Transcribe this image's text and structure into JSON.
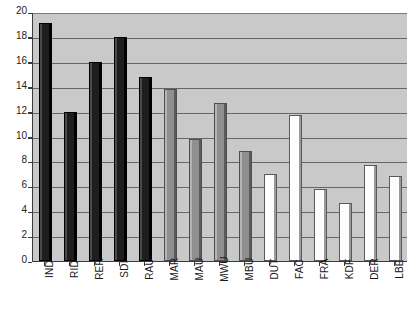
{
  "chart_data": {
    "type": "bar",
    "title": "",
    "subtitle": "",
    "xlabel": "",
    "ylabel": "",
    "ylim": [
      0,
      20
    ],
    "ytick_step": 2,
    "yticks": [
      "0",
      "2",
      "4",
      "6",
      "8",
      "10",
      "12",
      "14",
      "16",
      "18",
      "20"
    ],
    "grid": true,
    "legend": "none",
    "categories": [
      "IND",
      "RID",
      "RER",
      "SDI",
      "RAU",
      "MAR",
      "MAU",
      "MWU",
      "MBU",
      "DUT",
      "FAC",
      "FRA",
      "KDF",
      "DER",
      "LBE"
    ],
    "values": [
      19.1,
      12.0,
      16.0,
      18.0,
      14.8,
      13.8,
      9.8,
      12.7,
      8.8,
      7.0,
      11.7,
      5.8,
      4.7,
      7.7,
      6.8
    ],
    "bar_groups": [
      "dark",
      "dark",
      "dark",
      "dark",
      "dark",
      "mid",
      "mid",
      "mid",
      "mid",
      "light",
      "light",
      "light",
      "light",
      "light",
      "light"
    ],
    "colors": {
      "dark": "#1e1e1e",
      "mid": "#8f8f8f",
      "light": "#fdfdfd",
      "plot_background": "#c9c9c9",
      "gridline": "#666666",
      "axis": "#3b3b3b",
      "page_background": "#ffffff",
      "text": "#1a1a1a"
    },
    "bars": [
      {
        "category": "IND",
        "value": 19.1,
        "group": "dark"
      },
      {
        "category": "RID",
        "value": 12.0,
        "group": "dark"
      },
      {
        "category": "RER",
        "value": 16.0,
        "group": "dark"
      },
      {
        "category": "SDI",
        "value": 18.0,
        "group": "dark"
      },
      {
        "category": "RAU",
        "value": 14.8,
        "group": "dark"
      },
      {
        "category": "MAR",
        "value": 13.8,
        "group": "mid"
      },
      {
        "category": "MAU",
        "value": 9.8,
        "group": "mid"
      },
      {
        "category": "MWU",
        "value": 12.7,
        "group": "mid"
      },
      {
        "category": "MBU",
        "value": 8.8,
        "group": "mid"
      },
      {
        "category": "DUT",
        "value": 7.0,
        "group": "light"
      },
      {
        "category": "FAC",
        "value": 11.7,
        "group": "light"
      },
      {
        "category": "FRA",
        "value": 5.8,
        "group": "light"
      },
      {
        "category": "KDF",
        "value": 4.7,
        "group": "light"
      },
      {
        "category": "DER",
        "value": 7.7,
        "group": "light"
      },
      {
        "category": "LBE",
        "value": 6.8,
        "group": "light"
      }
    ]
  }
}
